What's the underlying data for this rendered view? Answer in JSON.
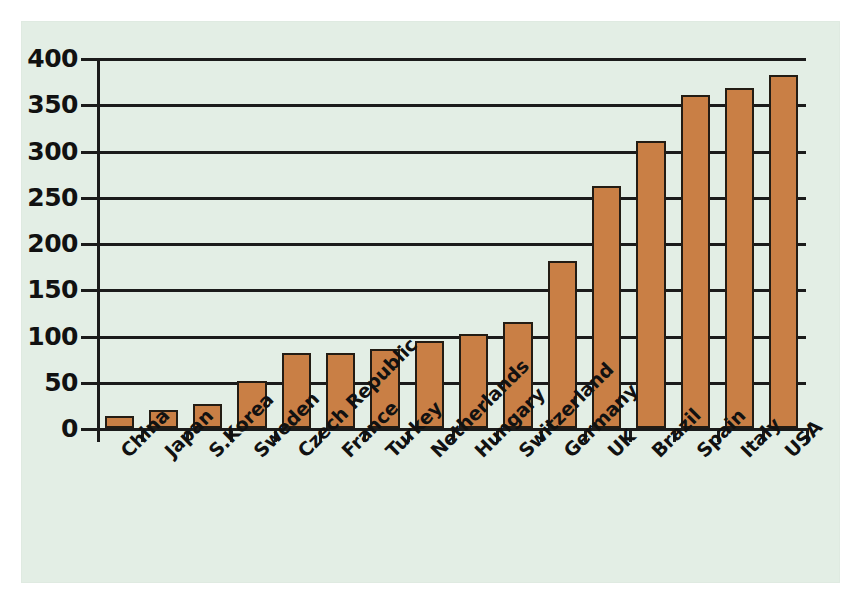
{
  "chart_data": {
    "type": "bar",
    "title": "",
    "subtitle": "",
    "xlabel": "",
    "ylabel": "",
    "categories": [
      "China",
      "Japan",
      "S.Korea",
      "Sweden",
      "Czech Republic",
      "France",
      "Turkey",
      "Netherlands",
      "Hungary",
      "Switzerland",
      "Germany",
      "UK",
      "Brazil",
      "Spain",
      "Italy",
      "USA"
    ],
    "values": [
      13,
      20,
      26,
      51,
      81,
      81,
      85,
      94,
      102,
      115,
      181,
      262,
      310,
      360,
      368,
      382
    ],
    "series": [
      {
        "name": "value",
        "values": [
          13,
          20,
          26,
          51,
          81,
          81,
          85,
          94,
          102,
          115,
          181,
          262,
          310,
          360,
          368,
          382
        ]
      }
    ],
    "ylim": [
      0,
      400
    ],
    "yticks": [
      0,
      50,
      100,
      150,
      200,
      250,
      300,
      350,
      400
    ],
    "ytick_labels": [
      "0",
      "50",
      "100",
      "150",
      "200",
      "250",
      "300",
      "350",
      "400"
    ],
    "grid": true,
    "legend": null,
    "legend_position": "none",
    "annotations": [],
    "bar_color": "#c97f45",
    "bar_edge_color": "#231c14",
    "plot_background": "#e3eee5",
    "axis_color": "#1b1b1b",
    "xtick_label_rotation": -45
  }
}
